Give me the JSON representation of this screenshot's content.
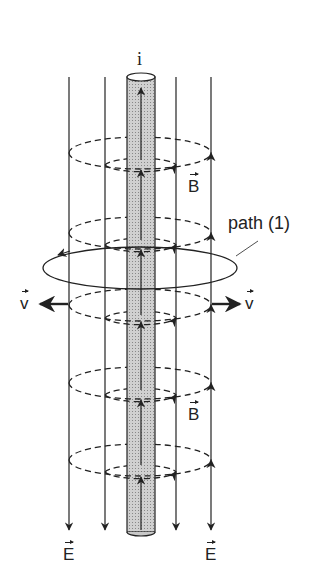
{
  "labels": {
    "current": "i",
    "field_b_upper": "B",
    "field_b_lower": "B",
    "path": "path (1)",
    "velocity_left": "v",
    "velocity_right": "v",
    "field_e_left": "E",
    "field_e_right": "E"
  },
  "colors": {
    "line": "#222222",
    "rod_fill": "#c8c8c8"
  }
}
